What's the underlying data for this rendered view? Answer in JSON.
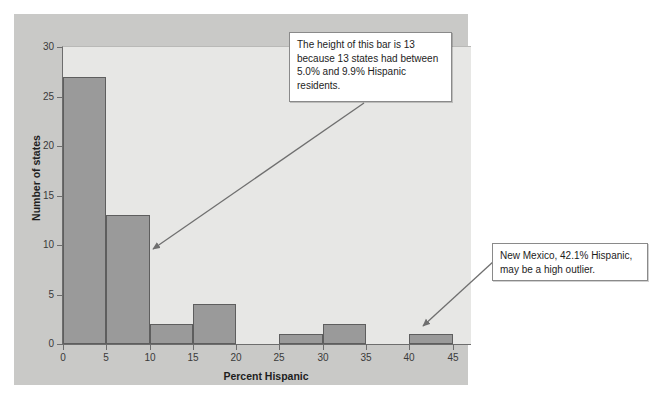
{
  "chart_data": {
    "type": "bar",
    "title": "",
    "xlabel": "Percent Hispanic",
    "ylabel": "Number of states",
    "xlim": [
      0,
      47
    ],
    "ylim": [
      0,
      30
    ],
    "xticks": [
      0,
      5,
      10,
      15,
      20,
      25,
      30,
      35,
      40,
      45
    ],
    "yticks": [
      0,
      5,
      10,
      15,
      20,
      25,
      30
    ],
    "grid": false,
    "legend": null,
    "bin_width": 5,
    "categories": [
      "0-5",
      "5-10",
      "10-15",
      "15-20",
      "20-25",
      "25-30",
      "30-35",
      "35-40",
      "40-45"
    ],
    "bin_starts": [
      0,
      5,
      10,
      15,
      20,
      25,
      30,
      35,
      40
    ],
    "values": [
      27,
      13,
      2,
      4,
      0,
      1,
      2,
      0,
      1
    ],
    "annotations": [
      {
        "id": "bar-height-note",
        "text": "The height of this bar is 13 because 13 states had between 5.0% and 9.9% Hispanic residents.",
        "points_to_bin": "5-10",
        "points_to_value": 13
      },
      {
        "id": "outlier-note",
        "text": "New Mexico, 42.1% Hispanic, may be a high outlier.",
        "points_to_bin": "40-45",
        "points_to_value": 1
      }
    ]
  },
  "axes": {
    "x_title": "Percent Hispanic",
    "y_title": "Number of states",
    "x_tick_labels": [
      "0",
      "5",
      "10",
      "15",
      "20",
      "25",
      "30",
      "35",
      "40",
      "45"
    ],
    "y_tick_labels": [
      "0",
      "5",
      "10",
      "15",
      "20",
      "25",
      "30"
    ]
  },
  "callouts": {
    "bar_note": "The height of this bar is 13 because 13 states had between 5.0% and 9.9% Hispanic residents.",
    "outlier_note": "New Mexico, 42.1% Hispanic, may be a high outlier."
  },
  "colors": {
    "page_background": "#ffffff",
    "figure_panel": "#c9c9c7",
    "plot_background": "#e7e7e5",
    "bar_fill": "#9a9a9a",
    "bar_edge": "#5e5e5e",
    "axis_line": "#6d6d6d",
    "callout_background": "#ffffff",
    "callout_border": "#8a8a8a",
    "arrow": "#6f6f6f",
    "text": "#1d1d1d"
  }
}
